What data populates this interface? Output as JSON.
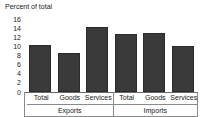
{
  "chart_data": {
    "type": "bar",
    "title": "Percent of total",
    "xlabel": "",
    "ylabel": "",
    "ylim": [
      0,
      16
    ],
    "yticks": [
      16,
      14,
      12,
      10,
      8,
      6,
      4,
      2,
      0
    ],
    "grid": false,
    "legend": false,
    "bar_color": "#3a3a3a",
    "categories": [
      "Total",
      "Goods",
      "Services"
    ],
    "groups": [
      {
        "name": "Exports",
        "bars": [
          {
            "label": "Total",
            "value": 10.3
          },
          {
            "label": "Goods",
            "value": 8.5
          },
          {
            "label": "Services",
            "value": 14.3
          }
        ]
      },
      {
        "name": "Imports",
        "bars": [
          {
            "label": "Total",
            "value": 12.7
          },
          {
            "label": "Goods",
            "value": 12.9
          },
          {
            "label": "Services",
            "value": 10.0
          }
        ]
      }
    ],
    "values_flat": [
      10.3,
      8.5,
      14.3,
      12.7,
      12.9,
      10.0
    ],
    "tick_labels_flat": [
      "Total",
      "Goods",
      "Services",
      "Total",
      "Goods",
      "Services"
    ],
    "group_labels_flat": [
      "Exports",
      "Imports"
    ]
  }
}
